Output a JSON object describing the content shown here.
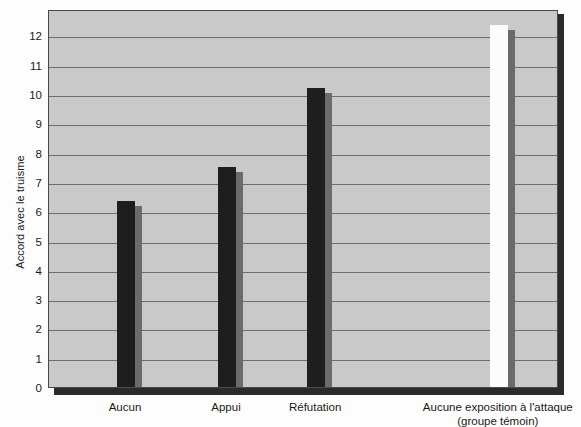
{
  "chart_data": {
    "type": "bar",
    "title": "",
    "xlabel": "",
    "ylabel": "Accord avec le truisme",
    "ylim": [
      0,
      12.9
    ],
    "yticks": [
      0,
      1,
      2,
      3,
      4,
      5,
      6,
      7,
      8,
      9,
      10,
      11,
      12
    ],
    "ytick_labels": [
      "0",
      "1",
      "2",
      "3",
      "4",
      "5",
      "6",
      "7",
      "8",
      "9",
      "10",
      "11",
      "12"
    ],
    "grid": true,
    "legend": "none",
    "categories": [
      "Aucun",
      "Appui",
      "Réfutation",
      "Aucune exposition à l'attaque (groupe témoin)"
    ],
    "values": [
      6.35,
      7.5,
      10.2,
      12.35
    ],
    "bars": [
      {
        "label": "Aucun",
        "label_line1": "Aucun",
        "label_line2": "",
        "value": 6.35,
        "fill": "#1e1e1e",
        "side": "#6b6b6b",
        "x_center_pct": 15.1,
        "width_px": 18
      },
      {
        "label": "Appui",
        "label_line1": "Appui",
        "label_line2": "",
        "value": 7.5,
        "fill": "#1e1e1e",
        "side": "#6b6b6b",
        "x_center_pct": 34.9,
        "width_px": 18
      },
      {
        "label": "Réfutation",
        "label_line1": "Réfutation",
        "label_line2": "",
        "value": 10.2,
        "fill": "#1e1e1e",
        "side": "#6b6b6b",
        "x_center_pct": 52.4,
        "width_px": 18
      },
      {
        "label": "Aucune exposition à l'attaque (groupe témoin)",
        "label_line1": "Aucune exposition à l'attaque",
        "label_line2": "(groupe témoin)",
        "value": 12.35,
        "fill": "#fcfcfc",
        "side": "#6b6b6b",
        "x_center_pct": 88.2,
        "width_px": 18
      }
    ],
    "colors": {
      "plot_background": "#c9c9c9",
      "gridline": "#6e6e6e",
      "frame": "#4a4a4a",
      "shadow": "#2a2a2a",
      "page_background": "#fdfdfd",
      "text": "#1a1a1a"
    }
  }
}
